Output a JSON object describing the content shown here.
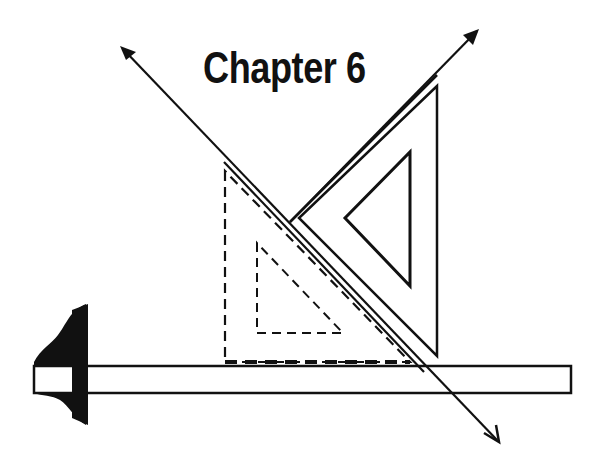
{
  "title": "Chapter 6",
  "figure": {
    "elements": [
      "t-square",
      "dashed-set-square",
      "solid-set-square",
      "arrow-line-1",
      "arrow-line-2"
    ]
  },
  "colors": {
    "ink": "#111111",
    "background": "#ffffff"
  }
}
